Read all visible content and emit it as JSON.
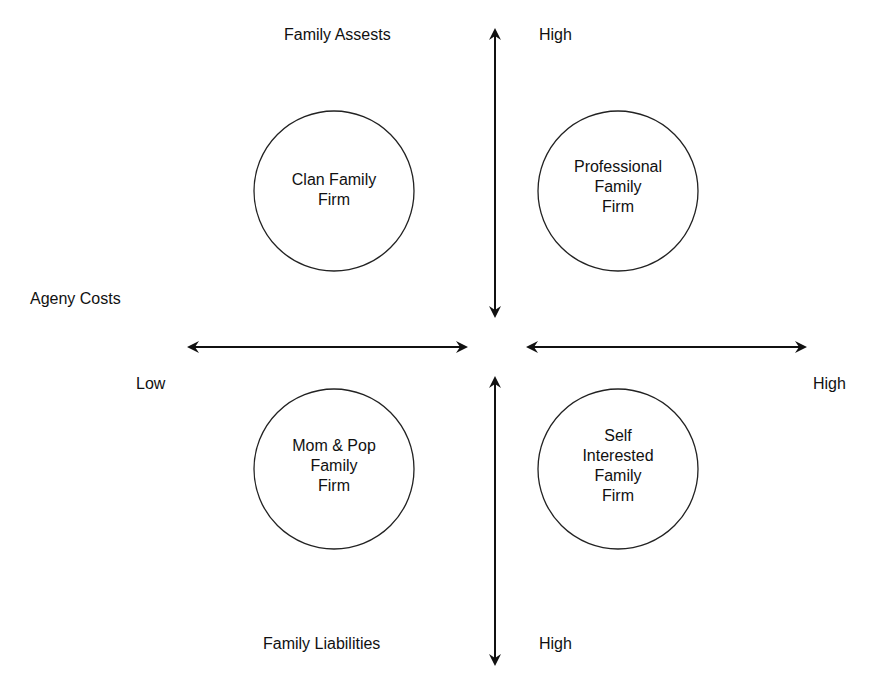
{
  "axes": {
    "vertical_top_label": "Family Assests",
    "vertical_top_end": "High",
    "vertical_bottom_label": "Family Liabilities",
    "vertical_bottom_end": "High",
    "horizontal_label": "Ageny Costs",
    "horizontal_left_end": "Low",
    "horizontal_right_end": "High"
  },
  "quadrants": [
    {
      "position": "top-left",
      "lines": [
        "Clan Family",
        "Firm"
      ]
    },
    {
      "position": "top-right",
      "lines": [
        "Professional",
        "Family",
        "Firm"
      ]
    },
    {
      "position": "bottom-left",
      "lines": [
        "Mom & Pop",
        "Family",
        "Firm"
      ]
    },
    {
      "position": "bottom-right",
      "lines": [
        "Self",
        "Interested",
        "Family",
        "Firm"
      ]
    }
  ]
}
